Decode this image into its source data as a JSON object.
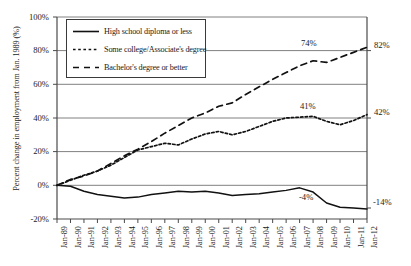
{
  "chart_data": {
    "type": "line",
    "title": "",
    "xlabel": "",
    "ylabel": "Percent change in employment from Jan. 1989 (%)",
    "ylim": [
      -20,
      100
    ],
    "ytick_labels": [
      "100%",
      "80%",
      "60%",
      "40%",
      "20%",
      "0%",
      "-20%"
    ],
    "ytick_values": [
      100,
      80,
      60,
      40,
      20,
      0,
      -20
    ],
    "grid": true,
    "grid_axis": "y",
    "legend_position": "upper-left-inside",
    "categories": [
      "Jan-89",
      "Jan-90",
      "Jan-91",
      "Jan-92",
      "Jan-93",
      "Jan-94",
      "Jan-95",
      "Jan-96",
      "Jan-97",
      "Jan-98",
      "Jan-99",
      "Jan-00",
      "Jan-01",
      "Jan-02",
      "Jan-03",
      "Jan-04",
      "Jan-05",
      "Jan-06",
      "Jan-07",
      "Jan-08",
      "Jan-09",
      "Jan-10",
      "Jan-11",
      "Jan-12"
    ],
    "series": [
      {
        "name": "High school diploma or less",
        "style": "solid",
        "color": "#111111",
        "values": [
          0,
          -0.5,
          -3.5,
          -5.5,
          -6.5,
          -7.5,
          -7.0,
          -5.5,
          -4.5,
          -3.5,
          -4.0,
          -3.5,
          -4.5,
          -6.0,
          -5.5,
          -5.0,
          -4.0,
          -3.0,
          -1.5,
          -4.0,
          -10.5,
          -13.0,
          -13.5,
          -14.0
        ]
      },
      {
        "name": "Some college/Associate's degree",
        "style": "dotted",
        "color": "#111111",
        "values": [
          0,
          3.0,
          6.0,
          8.5,
          12.0,
          16.5,
          21.0,
          23.0,
          25.0,
          24.0,
          27.5,
          30.5,
          32.0,
          30.0,
          32.0,
          35.0,
          38.0,
          40.0,
          40.5,
          41.0,
          38.0,
          36.0,
          38.5,
          42.0
        ]
      },
      {
        "name": "Bachelor's degree or better",
        "style": "dashed",
        "color": "#111111",
        "values": [
          0,
          3.5,
          5.5,
          8.5,
          13.0,
          17.5,
          21.5,
          26.0,
          31.0,
          35.5,
          40.0,
          43.0,
          47.0,
          49.0,
          54.0,
          58.5,
          63.0,
          67.0,
          71.0,
          74.0,
          73.0,
          76.0,
          79.0,
          82.0
        ]
      }
    ],
    "point_labels": [
      {
        "text": "74%",
        "series": "Bachelor's degree or better",
        "x": "Jan-08",
        "y": 74
      },
      {
        "text": "41%",
        "series": "Some college/Associate's degree",
        "x": "Jan-08",
        "y": 41
      },
      {
        "text": "-4%",
        "series": "High school diploma or less",
        "x": "Jan-08",
        "y": -4
      }
    ],
    "end_labels": [
      {
        "text": "82%",
        "series": "Bachelor's degree or better",
        "value": 82
      },
      {
        "text": "42%",
        "series": "Some college/Associate's degree",
        "value": 42
      },
      {
        "text": "-14%",
        "series": "High school diploma or less",
        "value": -14
      }
    ]
  },
  "legend": {
    "items": [
      {
        "label": "High school diploma or less",
        "style": "solid"
      },
      {
        "label": "Some college/Associate's degree",
        "style": "dotted"
      },
      {
        "label": "Bachelor's degree or better",
        "style": "dashed"
      }
    ]
  },
  "axis": {
    "y_title": "Percent change in employment from Jan. 1989 (%)"
  }
}
